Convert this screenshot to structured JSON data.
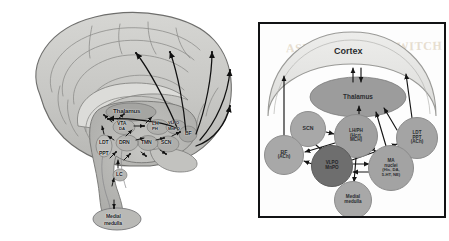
{
  "figure": {
    "watermark": "ASLEEP AT THE SWITCH"
  },
  "brain_panel": {
    "name": "sagittal-brain-diagram",
    "structures": [
      {
        "id": "thalamus",
        "label": "Thalamus",
        "x": 113,
        "y": 111,
        "size": "b-lg"
      },
      {
        "id": "vta",
        "label": "VTA",
        "x": 117,
        "y": 124,
        "size": "b-md"
      },
      {
        "id": "da",
        "label": "DA",
        "x": 119,
        "y": 129,
        "size": "b-sm"
      },
      {
        "id": "lh",
        "label": "LH",
        "x": 152,
        "y": 123,
        "size": "b-md"
      },
      {
        "id": "ph",
        "label": "PH",
        "x": 152,
        "y": 129,
        "size": "b-sm"
      },
      {
        "id": "vlpo",
        "label": "VLPO",
        "x": 168,
        "y": 123,
        "size": "b-sm"
      },
      {
        "id": "mnpo",
        "label": "MnPO",
        "x": 168,
        "y": 129,
        "size": "b-sm"
      },
      {
        "id": "bf",
        "label": "BF",
        "x": 185,
        "y": 133,
        "size": "b-md"
      },
      {
        "id": "ldt",
        "label": "LDT",
        "x": 100,
        "y": 142,
        "size": "b-md"
      },
      {
        "id": "ppt",
        "label": "PPT",
        "x": 100,
        "y": 153,
        "size": "b-md"
      },
      {
        "id": "drn",
        "label": "DRN",
        "x": 124,
        "y": 142,
        "size": "b-md"
      },
      {
        "id": "tmn",
        "label": "TMN",
        "x": 146,
        "y": 142,
        "size": "b-md"
      },
      {
        "id": "scn",
        "label": "SCN",
        "x": 165,
        "y": 143,
        "size": "b-md"
      },
      {
        "id": "lc",
        "label": "LC",
        "x": 117,
        "y": 174,
        "size": "b-md"
      },
      {
        "id": "medial-medulla-line1",
        "label": "Medial",
        "x": 108,
        "y": 216,
        "size": "b-md"
      },
      {
        "id": "medial-medulla-line2",
        "label": "medulla",
        "x": 106,
        "y": 222,
        "size": "b-md"
      }
    ]
  },
  "schema_panel": {
    "name": "sleep-wake-network-diagram",
    "cortex_label": "Cortex",
    "nodes": [
      {
        "id": "thalamus",
        "lines": [
          "Thalamus"
        ],
        "font": "s6",
        "cx": 98,
        "cy": 73,
        "rx": 48,
        "ry": 20,
        "fill": "#9c9c9c"
      },
      {
        "id": "scn",
        "lines": [
          "SCN"
        ],
        "font": "s5",
        "cx": 48,
        "cy": 105,
        "rx": 18,
        "ry": 18,
        "fill": "#a8a8a8"
      },
      {
        "id": "lh-ph",
        "lines": [
          "LH/PH",
          "(Hcrt,",
          "MCH)"
        ],
        "font": "s45",
        "cx": 96,
        "cy": 112,
        "rx": 22,
        "ry": 22,
        "fill": "#a0a0a0"
      },
      {
        "id": "ldt-ppt",
        "lines": [
          "LDT",
          "PPT",
          "(ACh)"
        ],
        "font": "s45",
        "cx": 157,
        "cy": 114,
        "rx": 21,
        "ry": 21,
        "fill": "#a4a4a4"
      },
      {
        "id": "bf",
        "lines": [
          "BF",
          "(ACh)"
        ],
        "font": "s5",
        "cx": 24,
        "cy": 131,
        "rx": 20,
        "ry": 20,
        "fill": "#a8a8a8"
      },
      {
        "id": "vlpo-mnpo",
        "lines": [
          "VLPO",
          "MnPO"
        ],
        "font": "s45",
        "cx": 72,
        "cy": 142,
        "rx": 21,
        "ry": 21,
        "fill": "#6e6e6e"
      },
      {
        "id": "ma-nuclei",
        "lines": [
          "MA",
          "nuclei",
          "(His, DA,",
          "5-HT, NE)"
        ],
        "font": "s4",
        "cx": 131,
        "cy": 144,
        "rx": 23,
        "ry": 23,
        "fill": "#a3a3a3"
      },
      {
        "id": "medial-medulla",
        "lines": [
          "Medial",
          "medulla"
        ],
        "font": "s45",
        "cx": 93,
        "cy": 176,
        "rx": 19,
        "ry": 19,
        "fill": "#a8a8a8"
      }
    ]
  },
  "colors": {
    "brain_tissue": "#c9c9c7",
    "brain_outline": "#6b6b6b",
    "arrow": "#101010",
    "panel_border": "#111214",
    "node_light": "#a8a8a8",
    "node_dark": "#6e6e6e",
    "cortex_fill": "#e3e3e1",
    "watermark": "#e7ded0"
  }
}
